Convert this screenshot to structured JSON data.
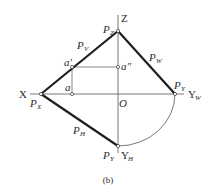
{
  "figure": {
    "caption": "(b)",
    "colors": {
      "stroke": "#2a2a2a",
      "thin": "#555555",
      "background": "#ffffff"
    },
    "axes": {
      "x_label": "X",
      "z_label": "Z",
      "yw_label": "Y",
      "yw_sub": "W",
      "yh_label": "Y",
      "yh_sub": "H",
      "origin_label": "O"
    },
    "traces": {
      "pv": {
        "main": "P",
        "sub": "V"
      },
      "pw": {
        "main": "P",
        "sub": "W"
      },
      "ph": {
        "main": "P",
        "sub": "H"
      }
    },
    "points": {
      "pz": {
        "main": "P",
        "sub": "Z"
      },
      "px": {
        "main": "P",
        "sub": "X"
      },
      "py_w": {
        "main": "P",
        "sub": "Y"
      },
      "py_h": {
        "main": "P",
        "sub": "Y"
      },
      "a_prime": "a′",
      "a_double_prime": "a″",
      "a": "a"
    }
  }
}
